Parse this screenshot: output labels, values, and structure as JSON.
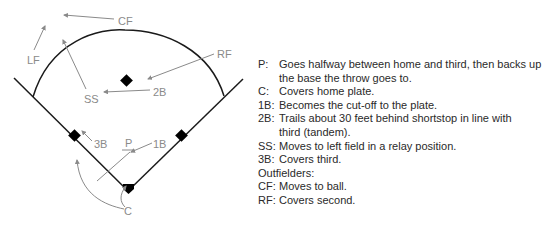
{
  "diagram": {
    "labels": {
      "cf": "CF",
      "lf": "LF",
      "rf": "RF",
      "ss": "SS",
      "second": "2B",
      "third": "3B",
      "pitcher": "P",
      "first": "1B",
      "catcher": "C"
    },
    "colors": {
      "field_lines": "#1a1a1a",
      "arrows": "#8a8a8a",
      "labels": "#8a8a8a",
      "bases": "#000000"
    }
  },
  "notes": {
    "items": [
      {
        "key": "P:",
        "text": "Goes halfway between home and third, then backs up the base the throw goes to."
      },
      {
        "key": "C:",
        "text": "Covers home plate."
      },
      {
        "key": "1B:",
        "text": "Becomes the cut-off to the plate."
      },
      {
        "key": "2B:",
        "text": "Trails about 30 feet behind shortstop in line with third (tandem)."
      },
      {
        "key": "SS:",
        "text": "Moves to left field in a relay position."
      },
      {
        "key": "3B:",
        "text": "Covers third."
      }
    ],
    "outfielders_heading": "Outfielders:",
    "outfielders": [
      {
        "key": "CF:",
        "text": "Moves to ball."
      },
      {
        "key": "RF:",
        "text": "Covers second."
      }
    ]
  }
}
